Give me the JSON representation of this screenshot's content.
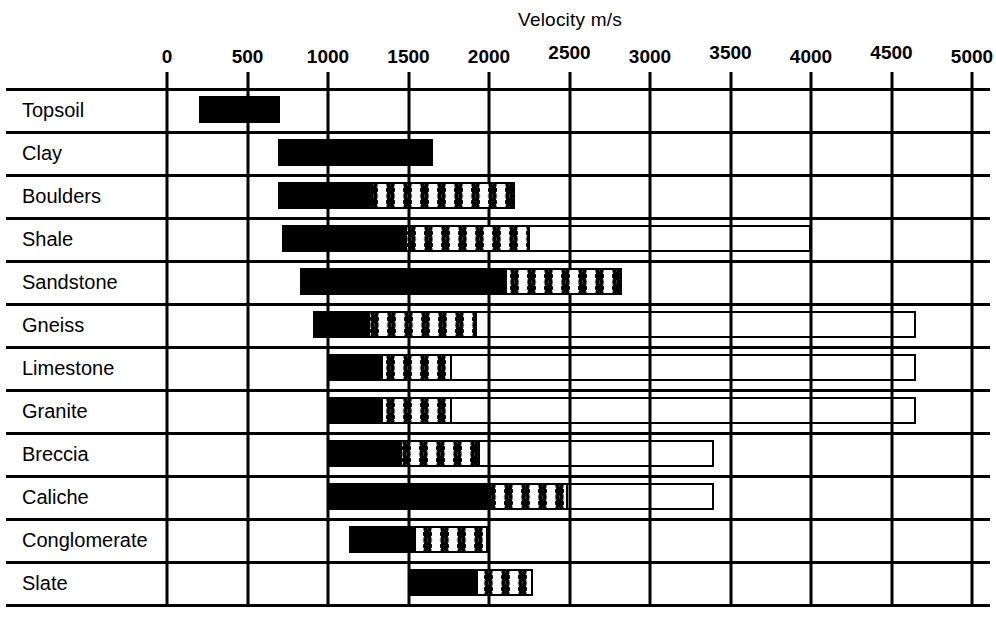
{
  "chart_data": {
    "type": "bar",
    "title": "Velocity m/s",
    "xlabel": "Velocity m/s",
    "ylabel": "",
    "xlim": [
      0,
      5000
    ],
    "xticks": [
      0,
      500,
      1000,
      1500,
      2000,
      2500,
      3000,
      3500,
      4000,
      4500,
      5000
    ],
    "xtick_labels": [
      "0",
      "500",
      "1000",
      "1500",
      "2000",
      "2500",
      "3000",
      "3500",
      "4000",
      "4500",
      "5000"
    ],
    "grid": true,
    "legend": "none",
    "orientation": "horizontal",
    "note": "Each material row shows a velocity range drawn as up to three nested segments: a solid black core range, a dotted (stippled) extension range, and an open outline extension range.",
    "categories": [
      "Topsoil",
      "Clay",
      "Boulders",
      "Shale",
      "Sandstone",
      "Gneiss",
      "Limestone",
      "Granite",
      "Breccia",
      "Caliche",
      "Conglomerate",
      "Slate"
    ],
    "rows": [
      {
        "label": "Topsoil",
        "start": 200,
        "solid_end": 700,
        "dotted_end": null,
        "outline_end": null
      },
      {
        "label": "Clay",
        "start": 690,
        "solid_end": 1650,
        "dotted_end": null,
        "outline_end": null
      },
      {
        "label": "Boulders",
        "start": 690,
        "solid_end": 1260,
        "dotted_end": 2160,
        "outline_end": null
      },
      {
        "label": "Shale",
        "start": 715,
        "solid_end": 1490,
        "dotted_end": 2255,
        "outline_end": 4000
      },
      {
        "label": "Sandstone",
        "start": 825,
        "solid_end": 2110,
        "dotted_end": 2825,
        "outline_end": null
      },
      {
        "label": "Gneiss",
        "start": 905,
        "solid_end": 1260,
        "dotted_end": 1925,
        "outline_end": 4650
      },
      {
        "label": "Limestone",
        "start": 1005,
        "solid_end": 1340,
        "dotted_end": 1770,
        "outline_end": 4650
      },
      {
        "label": "Granite",
        "start": 1005,
        "solid_end": 1340,
        "dotted_end": 1770,
        "outline_end": 4650
      },
      {
        "label": "Breccia",
        "start": 1000,
        "solid_end": 1460,
        "dotted_end": 1945,
        "outline_end": 3400
      },
      {
        "label": "Caliche",
        "start": 1000,
        "solid_end": 1995,
        "dotted_end": 2490,
        "outline_end": 3400
      },
      {
        "label": "Conglomerate",
        "start": 1130,
        "solid_end": 1545,
        "dotted_end": 1995,
        "outline_end": null
      },
      {
        "label": "Slate",
        "start": 1510,
        "solid_end": 1930,
        "dotted_end": 2275,
        "outline_end": null
      }
    ]
  },
  "colors": {
    "ink": "#000000",
    "paper": "#ffffff"
  }
}
